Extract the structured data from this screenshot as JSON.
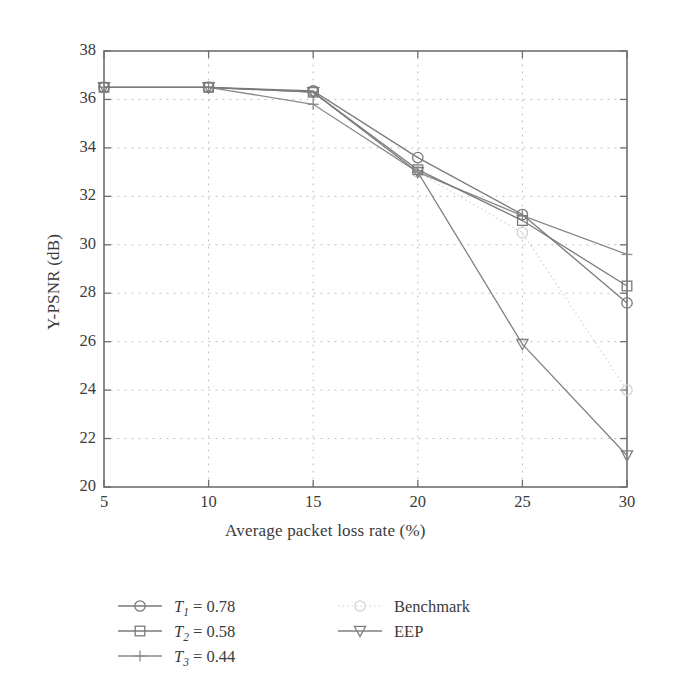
{
  "chart_data": {
    "type": "line",
    "title": "",
    "xlabel": "Average packet loss rate (%)",
    "ylabel": "Y-PSNR (dB)",
    "x": [
      5,
      10,
      15,
      20,
      25,
      30
    ],
    "xlim": [
      5,
      30
    ],
    "ylim": [
      20,
      38
    ],
    "xticks": [
      "5",
      "10",
      "15",
      "20",
      "25",
      "30"
    ],
    "yticks": [
      "20",
      "22",
      "24",
      "26",
      "28",
      "30",
      "32",
      "34",
      "36",
      "38"
    ],
    "grid": true,
    "grid_style": "dotted",
    "legend_position": "below-plot",
    "series": [
      {
        "name": "T_1 = 0.78",
        "label_base": "T",
        "label_sub": "1",
        "label_value": "= 0.78",
        "marker": "circle",
        "line": "solid",
        "color": "#7a7a7a",
        "values": [
          36.5,
          36.5,
          36.35,
          33.6,
          31.25,
          27.6
        ]
      },
      {
        "name": "T_2 = 0.58",
        "label_base": "T",
        "label_sub": "2",
        "label_value": "= 0.58",
        "marker": "square",
        "line": "solid",
        "color": "#7a7a7a",
        "values": [
          36.5,
          36.5,
          36.3,
          33.1,
          31.0,
          28.3
        ]
      },
      {
        "name": "T_3 = 0.44",
        "label_base": "T",
        "label_sub": "3",
        "label_value": "= 0.44",
        "marker": "plus",
        "line": "solid",
        "color": "#8a8a8a",
        "values": [
          36.5,
          36.5,
          35.8,
          33.0,
          31.2,
          29.6
        ]
      },
      {
        "name": "Benchmark",
        "label_base": "Benchmark",
        "label_sub": "",
        "label_value": "",
        "marker": "circle",
        "line": "dotted",
        "color": "#d2d2d2",
        "values": [
          36.5,
          36.5,
          36.3,
          33.0,
          30.5,
          24.0
        ]
      },
      {
        "name": "EEP",
        "label_base": "EEP",
        "label_sub": "",
        "label_value": "",
        "marker": "triangle-down",
        "line": "solid",
        "color": "#808080",
        "values": [
          36.5,
          36.5,
          36.3,
          33.0,
          25.9,
          21.3
        ]
      }
    ]
  },
  "axes": {
    "frame_color": "#6f6f6f",
    "grid_color": "#b9b9b9"
  },
  "legend": {
    "entries": [
      {
        "key": "T1",
        "text_base": "T",
        "sub": "1",
        "rest": " = 0.78",
        "marker": "circle",
        "line": "solid"
      },
      {
        "key": "T2",
        "text_base": "T",
        "sub": "2",
        "rest": " = 0.58",
        "marker": "square",
        "line": "solid"
      },
      {
        "key": "T3",
        "text_base": "T",
        "sub": "3",
        "rest": " = 0.44",
        "marker": "plus",
        "line": "solid"
      },
      {
        "key": "benchmark",
        "text_base": "Benchmark",
        "sub": "",
        "rest": "",
        "marker": "circle",
        "line": "dotted"
      },
      {
        "key": "eep",
        "text_base": "EEP",
        "sub": "",
        "rest": "",
        "marker": "triangle-down",
        "line": "solid"
      }
    ],
    "benchmark_label": "Benchmark",
    "eep_label": "EEP"
  }
}
